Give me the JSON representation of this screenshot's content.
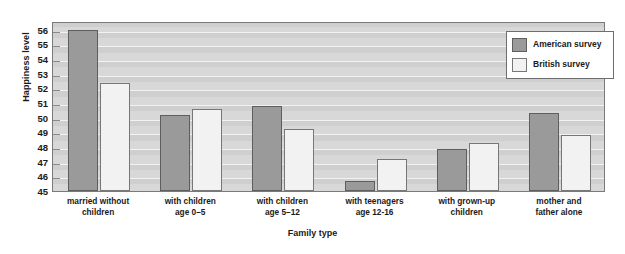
{
  "chart_data": {
    "type": "bar",
    "title": "",
    "xlabel": "Family type",
    "ylabel": "Happiness level",
    "ylim": [
      45,
      56.6
    ],
    "yticks": [
      45,
      46,
      47,
      48,
      49,
      50,
      51,
      52,
      53,
      54,
      55,
      56
    ],
    "grid": true,
    "legend_position": "top-right",
    "categories": [
      "married without\nchildren",
      "with children\nage 0–5",
      "with children\nage 5–12",
      "with teenagers\nage 12-16",
      "with grown-up\nchildren",
      "mother and\nfather alone"
    ],
    "category_lines": [
      [
        "married without",
        "children"
      ],
      [
        "with children",
        "age 0–5"
      ],
      [
        "with children",
        "age 5–12"
      ],
      [
        "with teenagers",
        "age 12-16"
      ],
      [
        "with grown-up",
        "children"
      ],
      [
        "mother and",
        "father alone"
      ]
    ],
    "series": [
      {
        "name": "American survey",
        "color": "#9a9a9a",
        "values": [
          56.0,
          50.2,
          50.8,
          45.7,
          47.9,
          50.3
        ]
      },
      {
        "name": "British survey",
        "color": "#f2f2f2",
        "values": [
          52.4,
          50.6,
          49.2,
          47.2,
          48.3,
          48.8
        ]
      }
    ]
  },
  "legend": {
    "entries": [
      {
        "label": "American survey",
        "swatch": "american"
      },
      {
        "label": "British survey",
        "swatch": "british"
      }
    ]
  },
  "colors": {
    "american_fill": "#9a9a9a",
    "american_edge": "#5e5e5e",
    "british_fill": "#f2f2f2",
    "british_edge": "#777777",
    "plot_background": "#d8d8d8",
    "grid_line": "#f2f2f2",
    "frame": "#7a7a7a",
    "page_background": "#ffffff"
  }
}
